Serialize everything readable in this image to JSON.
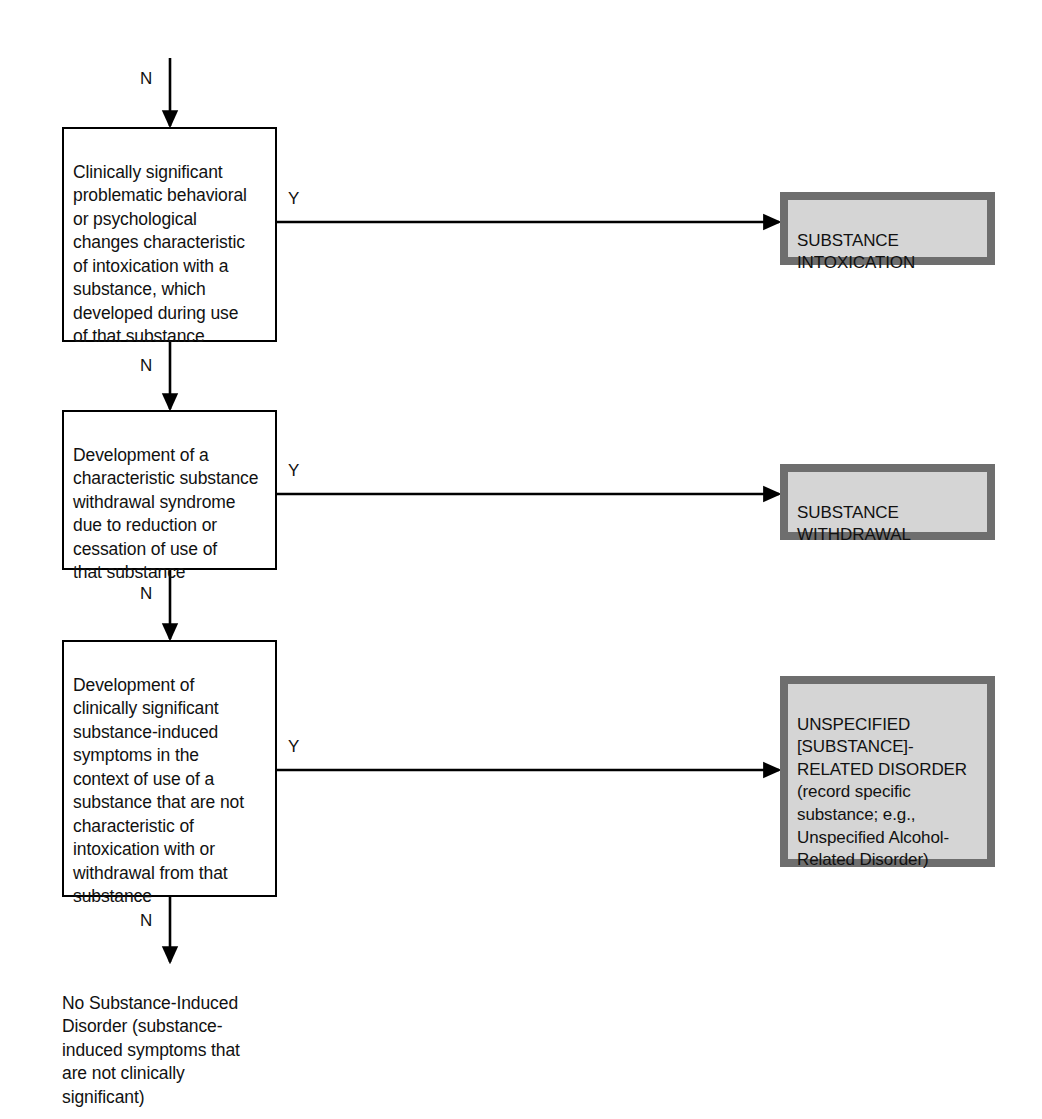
{
  "diagram": {
    "colors": {
      "outcome_fill": "#d5d5d5",
      "outcome_border": "#6e6e6e",
      "criterion_fill": "#ffffff",
      "line": "#000000"
    }
  },
  "entry": {
    "label": "N"
  },
  "criteria": [
    {
      "id": "intoxication-criterion",
      "text": "Clinically significant\nproblematic behavioral\nor psychological\nchanges characteristic\nof intoxication with a\nsubstance, which\ndeveloped during use\nof that substance",
      "yes_label": "Y",
      "no_label": "N"
    },
    {
      "id": "withdrawal-criterion",
      "text": "Development of a\ncharacteristic substance\nwithdrawal syndrome\ndue to reduction or\ncessation of use of\nthat substance",
      "yes_label": "Y",
      "no_label": "N"
    },
    {
      "id": "unspecified-criterion",
      "text": "Development of\nclinically significant\nsubstance-induced\nsymptoms in the\ncontext of use of a\nsubstance that are not\ncharacteristic of\nintoxication with or\nwithdrawal from that\nsubstance",
      "yes_label": "Y",
      "no_label": "N"
    }
  ],
  "outcomes": [
    {
      "id": "substance-intoxication",
      "text": "SUBSTANCE\nINTOXICATION"
    },
    {
      "id": "substance-withdrawal",
      "text": "SUBSTANCE\nWITHDRAWAL"
    },
    {
      "id": "unspecified-substance-related-disorder",
      "text": "UNSPECIFIED\n[SUBSTANCE]-\nRELATED DISORDER\n(record specific\nsubstance; e.g.,\nUnspecified Alcohol-\nRelated Disorder)"
    }
  ],
  "terminal": {
    "id": "no-substance-induced-disorder",
    "text": "No Substance-Induced\nDisorder (substance-\ninduced symptoms that\nare not clinically\nsignificant)"
  }
}
